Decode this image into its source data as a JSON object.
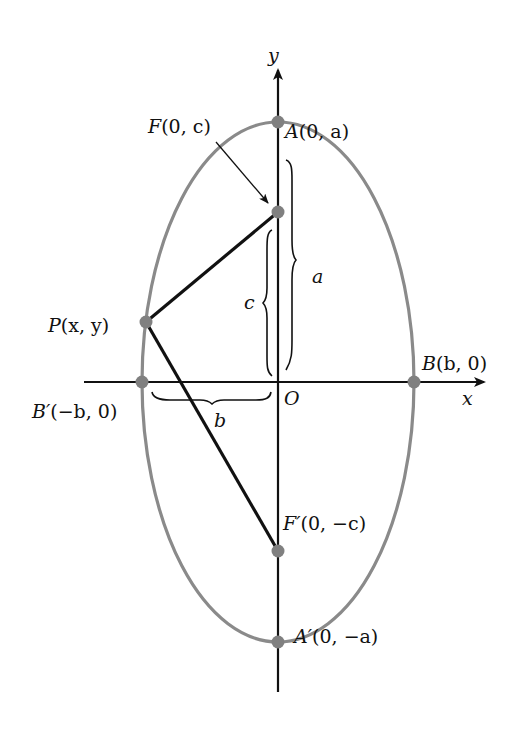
{
  "diagram": {
    "type": "ellipse-vertical-major-axis",
    "colors": {
      "ellipse": "#8a8a8a",
      "points": "#808080",
      "lines": "#111111",
      "background": "#ffffff"
    },
    "axes": {
      "x_label": "x",
      "y_label": "y",
      "origin_label": "O"
    },
    "points": {
      "A": {
        "name": "A",
        "coords": "(0, a)"
      },
      "A_prime": {
        "name": "A′",
        "coords": "(0, −a)"
      },
      "B": {
        "name": "B",
        "coords": "(b, 0)"
      },
      "B_prime": {
        "name": "B′",
        "coords": "(−b, 0)"
      },
      "F": {
        "name": "F",
        "coords": "(0, c)"
      },
      "F_prime": {
        "name": "F′",
        "coords": "(0, −c)"
      },
      "P": {
        "name": "P",
        "coords": "(x, y)"
      }
    },
    "braces": {
      "a": "a",
      "b": "b",
      "c": "c"
    }
  }
}
